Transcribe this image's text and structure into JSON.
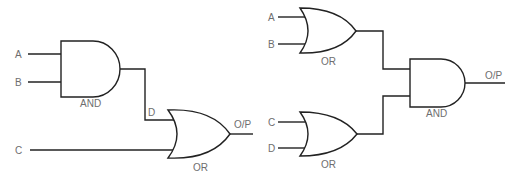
{
  "diagrams": [
    {
      "name": "circuit-1",
      "inputs": [
        "A",
        "B",
        "C"
      ],
      "intermediate": "D",
      "gates": [
        {
          "type": "AND",
          "label": "AND"
        },
        {
          "type": "OR",
          "label": "OR"
        }
      ],
      "output": "O/P"
    },
    {
      "name": "circuit-2",
      "inputs": [
        "A",
        "B",
        "C",
        "D"
      ],
      "gates": [
        {
          "type": "OR",
          "label": "OR"
        },
        {
          "type": "OR",
          "label": "OR"
        },
        {
          "type": "AND",
          "label": "AND"
        }
      ],
      "output": "O/P"
    }
  ],
  "colors": {
    "line": "#222222",
    "label": "#6e6e6e",
    "background": "#ffffff"
  }
}
